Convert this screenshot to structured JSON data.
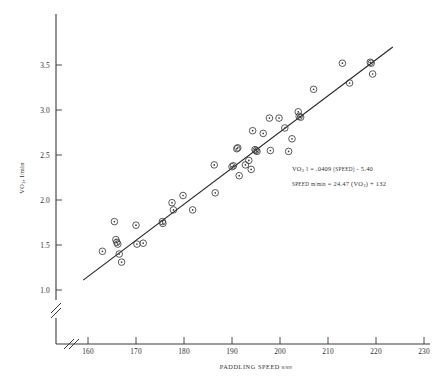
{
  "chart_data": {
    "type": "scatter",
    "title": "",
    "xlabel": "PADDLING SPEED",
    "xlabel_unit": "m/min",
    "ylabel": "VO",
    "ylabel_sub": "2",
    "ylabel_unit": ", l/min",
    "xlim": [
      155,
      232
    ],
    "ylim": [
      0.95,
      3.78
    ],
    "xticks": [
      160,
      170,
      180,
      190,
      200,
      210,
      220,
      230
    ],
    "xtick_labels": [
      "160",
      "170",
      "180",
      "190",
      "200",
      "210",
      "220",
      "230"
    ],
    "yticks": [
      1.0,
      1.5,
      2.0,
      2.5,
      3.0,
      3.5
    ],
    "ytick_labels": [
      "1.0",
      "1.5",
      "2.0",
      "2.5",
      "3.0",
      "3.5"
    ],
    "grid": false,
    "legend": "none",
    "axis_break_x": true,
    "axis_break_y": true,
    "marker_style": "circle-with-center-dot",
    "series": [
      {
        "name": "VO2 vs paddling speed",
        "x": [
          163.0,
          165.5,
          165.8,
          166.0,
          166.2,
          166.5,
          167.0,
          170.0,
          170.2,
          171.5,
          175.5,
          175.6,
          177.5,
          177.8,
          179.8,
          181.8,
          186.3,
          186.5,
          190.0,
          190.3,
          191.0,
          191.2,
          191.5,
          192.8,
          193.5,
          194.0,
          194.3,
          194.8,
          195.0,
          195.2,
          196.5,
          197.8,
          198.0,
          199.8,
          201.0,
          201.8,
          202.5,
          203.8,
          204.0,
          204.3,
          207.0,
          213.0,
          214.5,
          218.8,
          219.0,
          219.3
        ],
        "y": [
          1.43,
          1.76,
          1.56,
          1.53,
          1.51,
          1.4,
          1.31,
          1.72,
          1.51,
          1.52,
          1.76,
          1.74,
          1.97,
          1.89,
          2.05,
          1.89,
          2.39,
          2.08,
          2.37,
          2.38,
          2.57,
          2.58,
          2.27,
          2.39,
          2.44,
          2.34,
          2.77,
          2.56,
          2.55,
          2.54,
          2.74,
          2.91,
          2.55,
          2.91,
          2.8,
          2.54,
          2.68,
          2.98,
          2.93,
          2.92,
          3.23,
          3.52,
          3.3,
          3.53,
          3.52,
          3.4
        ]
      }
    ],
    "regression_line": {
      "x_start": 159.0,
      "y_start": 1.11,
      "x_end": 223.5,
      "y_end": 3.7
    },
    "annotations": [
      {
        "id": "vo2-equation",
        "parts": [
          {
            "text": "VO",
            "style": "normal"
          },
          {
            "text": "2",
            "style": "sub"
          },
          {
            "text": " l = .0409 ",
            "style": "normal"
          },
          {
            "text": "(SPEED)",
            "style": "smallcaps"
          },
          {
            "text": " - 5.40",
            "style": "normal"
          }
        ]
      },
      {
        "id": "speed-equation",
        "parts": [
          {
            "text": "SPEED",
            "style": "smallcaps"
          },
          {
            "text": " m/min",
            "style": "smallcaps"
          },
          {
            "text": " = 24.47 (VO",
            "style": "normal"
          },
          {
            "text": "2",
            "style": "sub"
          },
          {
            "text": ") + 132",
            "style": "normal"
          }
        ]
      }
    ]
  },
  "caption": {
    "text": ""
  }
}
